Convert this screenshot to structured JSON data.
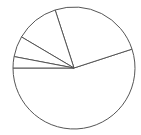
{
  "chart_data": {
    "type": "pie",
    "title": "",
    "labels": [
      "",
      "",
      "",
      "",
      ""
    ],
    "values": [
      55,
      25,
      11.5,
      5.5,
      3
    ],
    "start_angle_deg": 180,
    "direction": "counterclockwise",
    "colors": {
      "fill": "#ffffff",
      "stroke": "#555555"
    },
    "legend": false
  },
  "geometry": {
    "cx": 74,
    "cy": 68,
    "r": 61
  }
}
